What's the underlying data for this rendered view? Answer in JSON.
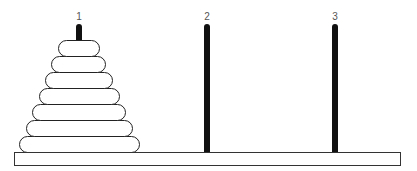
{
  "pegs": [
    {
      "label": "1",
      "x": 76
    },
    {
      "label": "2",
      "x": 204
    },
    {
      "label": "3",
      "x": 332
    }
  ],
  "disks_on_peg_1": 7
}
